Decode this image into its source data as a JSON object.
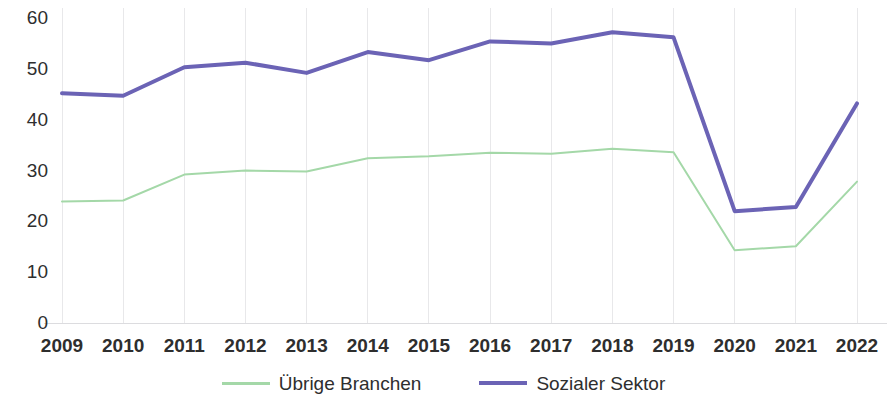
{
  "chart_data": {
    "type": "line",
    "title": "",
    "subtitle": "",
    "xlabel": "",
    "ylabel": "",
    "categories": [
      "2009",
      "2010",
      "2011",
      "2012",
      "2013",
      "2014",
      "2015",
      "2016",
      "2017",
      "2018",
      "2019",
      "2020",
      "2021",
      "2022"
    ],
    "x": [
      2009,
      2010,
      2011,
      2012,
      2013,
      2014,
      2015,
      2016,
      2017,
      2018,
      2019,
      2020,
      2021,
      2022
    ],
    "ylim": [
      0,
      60
    ],
    "xlim": [
      2009,
      2022
    ],
    "y_ticks": [
      0,
      10,
      20,
      30,
      40,
      50,
      60
    ],
    "y_tick_labels": [
      "0",
      "10",
      "20",
      "30",
      "40",
      "50",
      "60"
    ],
    "grid": {
      "vertical": true,
      "horizontal": false,
      "color": "#e8e8ea"
    },
    "legend_position": "bottom-center",
    "series": [
      {
        "name": "Übrige Branchen",
        "color": "#A4D8A8",
        "line_width": 2,
        "values": [
          23.9,
          24.1,
          29.2,
          30.0,
          29.8,
          32.4,
          32.8,
          33.5,
          33.3,
          34.3,
          33.6,
          14.3,
          15.1,
          27.8
        ]
      },
      {
        "name": "Sozialer Sektor",
        "color": "#6B63B5",
        "line_width": 4,
        "values": [
          45.2,
          44.7,
          50.3,
          51.2,
          49.2,
          53.3,
          51.7,
          55.4,
          55.0,
          57.2,
          56.2,
          22.0,
          22.8,
          43.2
        ]
      }
    ]
  },
  "legend": {
    "items": [
      {
        "label": "Übrige Branchen"
      },
      {
        "label": "Sozialer Sektor"
      }
    ]
  }
}
